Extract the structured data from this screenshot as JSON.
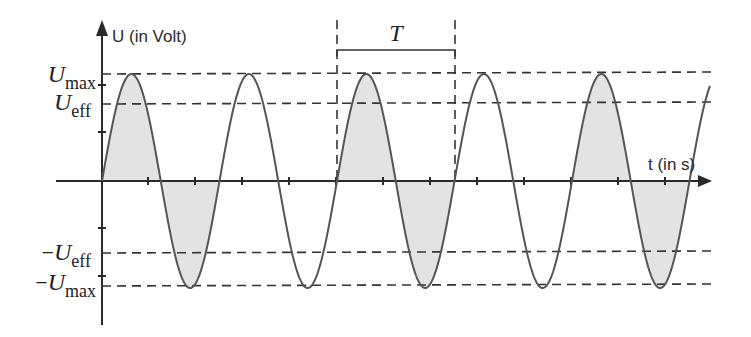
{
  "diagram": {
    "y_axis_label": "U (in Volt)",
    "x_axis_label": "t (in s)",
    "period_label": "T",
    "levels": {
      "umax": {
        "sign": "",
        "symbol": "U",
        "sub": "max"
      },
      "ueff": {
        "sign": "",
        "symbol": "U",
        "sub": "eff"
      },
      "neg_ueff": {
        "sign": "−",
        "symbol": "U",
        "sub": "eff"
      },
      "neg_umax": {
        "sign": "−",
        "symbol": "U",
        "sub": "max"
      }
    },
    "colors": {
      "axis": "#2a2a2a",
      "curve": "#555555",
      "shade": "#e3e3e3",
      "dashed": "#333333"
    }
  },
  "chart_data": {
    "type": "line",
    "function": "U(t) = U_max * sin(2*pi*t/T)",
    "origin_px": [
      102,
      181
    ],
    "period_px": 117.5,
    "amplitude_px": 107,
    "x_end_px": 710,
    "ueff_ratio": 0.707,
    "shaded_periods": [
      0,
      2,
      4
    ],
    "x_ticks_px": [
      148,
      195,
      242,
      289,
      336,
      383,
      430,
      477,
      524,
      571,
      618,
      665
    ],
    "y_ticks_px": [
      85,
      132,
      228,
      276
    ],
    "period_marker_px": [
      337,
      455
    ],
    "xlabel": "t (in s)",
    "ylabel": "U (in Volt)",
    "annotations": [
      "U_max",
      "U_eff",
      "-U_eff",
      "-U_max",
      "T"
    ]
  }
}
